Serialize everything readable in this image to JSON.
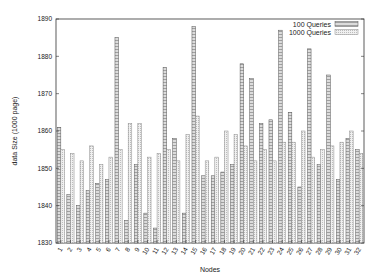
{
  "chart_data": {
    "type": "bar",
    "title": "",
    "xlabel": "Nodes",
    "ylabel": "data Size (1000 page)",
    "ylim": [
      1830,
      1890
    ],
    "yticks": [
      1830,
      1840,
      1850,
      1860,
      1870,
      1880,
      1890
    ],
    "grid": false,
    "legend_position": "top-right",
    "categories": [
      "1",
      "2",
      "3",
      "4",
      "5",
      "6",
      "7",
      "8",
      "9",
      "10",
      "11",
      "12",
      "13",
      "14",
      "15",
      "16",
      "17",
      "18",
      "19",
      "20",
      "21",
      "22",
      "23",
      "24",
      "25",
      "26",
      "27",
      "28",
      "29",
      "30",
      "31",
      "32"
    ],
    "series": [
      {
        "name": "100 Queries",
        "pattern": "dense-hatch",
        "values": [
          1861,
          1843,
          1840,
          1844,
          1846,
          1847,
          1885,
          1836,
          1851,
          1838,
          1834,
          1877,
          1858,
          1838,
          1888,
          1848,
          1848,
          1849,
          1851,
          1878,
          1874,
          1862,
          1863,
          1887,
          1865,
          1845,
          1882,
          1851,
          1875,
          1847,
          1858,
          1855
        ]
      },
      {
        "name": "1000 Queries",
        "pattern": "light-dots",
        "values": [
          1855,
          1854,
          1852,
          1856,
          1851,
          1853,
          1855,
          1862,
          1862,
          1853,
          1854,
          1855,
          1852,
          1859,
          1864,
          1852,
          1853,
          1860,
          1859,
          1856,
          1852,
          1855,
          1852,
          1857,
          1857,
          1860,
          1853,
          1855,
          1856,
          1857,
          1860,
          1854
        ]
      }
    ]
  },
  "colors": {
    "axis": "#333333",
    "bar_outline_100": "#555555",
    "bar_fill_100": "#d8d8d8",
    "bar_outline_1000": "#888888",
    "bar_fill_1000": "#ececec"
  }
}
